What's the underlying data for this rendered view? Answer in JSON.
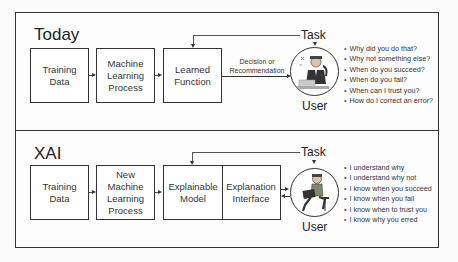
{
  "today": {
    "title": "Today",
    "boxes": [
      {
        "line1": "Training",
        "line2": "Data"
      },
      {
        "line1": "Machine",
        "line2": "Learning",
        "line3": "Process"
      },
      {
        "line1": "Learned",
        "line2": "Function"
      }
    ],
    "task_label": "Task",
    "decision_label_1": "Decision or",
    "decision_label_2": "Recommendation",
    "user_label": "User",
    "questions": [
      "Why did you do that?",
      "Why not something else?",
      "When do you succeed?",
      "When do you fail?",
      "When can I trust you?",
      "How do I correct an error?"
    ]
  },
  "xai": {
    "title": "XAI",
    "boxes": [
      {
        "line1": "Training",
        "line2": "Data"
      },
      {
        "line1": "New",
        "line2": "Machine",
        "line3": "Learning",
        "line4": "Process"
      },
      {
        "line1": "Explainable",
        "line2": "Model"
      },
      {
        "line1": "Explanation",
        "line2": "Interface"
      }
    ],
    "task_label": "Task",
    "user_label": "User",
    "statements": [
      "I understand why",
      "I understand why not",
      "I know when you succeed",
      "I know when you fail",
      "I know when to trust you",
      "I know why you erred"
    ]
  },
  "icons": {
    "user_today": "confused-user-at-desk-icon",
    "user_xai": "user-with-laptop-icon"
  }
}
